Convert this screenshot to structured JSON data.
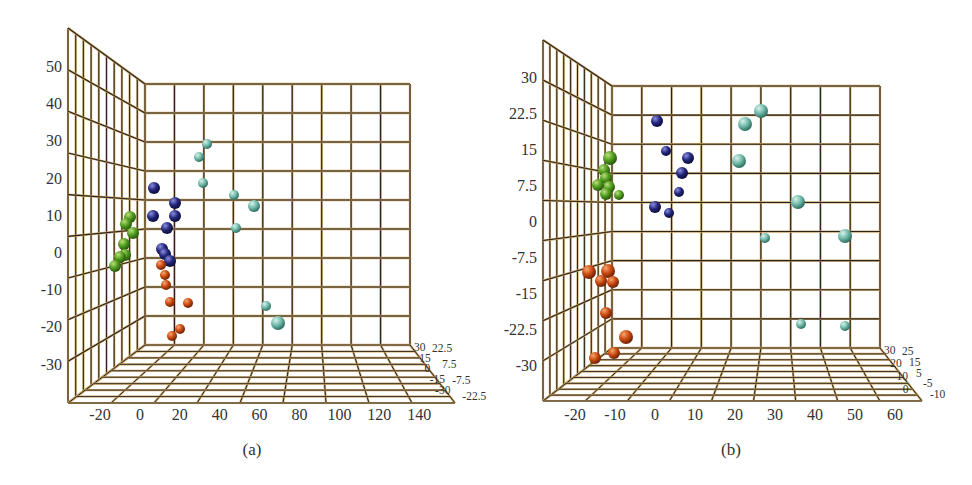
{
  "figure": {
    "panels": [
      "(a)",
      "(b)"
    ]
  },
  "colors": {
    "grid_dark": "#2b2418",
    "grid_tan": "#c8a46a",
    "green": "#4f9a1e",
    "navy": "#23257a",
    "orange": "#c9480f",
    "teal": "#6fb8a8"
  },
  "chart_data": [
    {
      "type": "scatter",
      "subtype": "3d-scatter",
      "caption": "(a)",
      "xlabel": "",
      "ylabel": "",
      "zlabel": "",
      "x_ticks": [
        "-20",
        "0",
        "20",
        "40",
        "60",
        "80",
        "100",
        "120",
        "140"
      ],
      "y_ticks": [
        "50",
        "40",
        "30",
        "20",
        "10",
        "0",
        "-10",
        "-20",
        "-30"
      ],
      "z_ticks_left": [
        "30",
        "15",
        "0",
        "-15",
        "-30"
      ],
      "z_ticks_right": [
        "22.5",
        "7.5",
        "-7.5",
        "-22.5"
      ],
      "xlim": [
        -30,
        150
      ],
      "ylim": [
        -40,
        60
      ],
      "zlim": [
        -30,
        30
      ],
      "grid": true,
      "series": [
        {
          "name": "cluster-green",
          "color": "#4f9a1e",
          "points": [
            [
              -18,
              9
            ],
            [
              -19,
              6
            ],
            [
              -20,
              4
            ],
            [
              -19,
              1
            ],
            [
              -20,
              -1
            ],
            [
              -19,
              -2
            ],
            [
              -24,
              -4
            ]
          ]
        },
        {
          "name": "cluster-navy",
          "color": "#23257a",
          "points": [
            [
              0,
              17
            ],
            [
              10,
              13
            ],
            [
              -2,
              10
            ],
            [
              10,
              10
            ],
            [
              6,
              7
            ],
            [
              2,
              0
            ],
            [
              4,
              -1
            ],
            [
              6,
              -2
            ]
          ]
        },
        {
          "name": "cluster-orange",
          "color": "#c9480f",
          "points": [
            [
              2,
              -4
            ],
            [
              4,
              -6
            ],
            [
              4,
              -9
            ],
            [
              6,
              -14
            ],
            [
              18,
              -14
            ],
            [
              10,
              -22
            ],
            [
              6,
              -24
            ]
          ]
        },
        {
          "name": "cluster-teal",
          "color": "#6fb8a8",
          "points": [
            [
              35,
              29
            ],
            [
              30,
              26
            ],
            [
              32,
              18
            ],
            [
              47,
              15
            ],
            [
              58,
              12
            ],
            [
              48,
              6
            ],
            [
              60,
              -16
            ],
            [
              68,
              -20
            ]
          ]
        }
      ],
      "screen_points": {
        "green": [
          [
            130,
            217,
            6
          ],
          [
            126,
            224,
            6
          ],
          [
            133,
            233,
            6
          ],
          [
            124,
            244,
            6
          ],
          [
            125,
            255,
            6
          ],
          [
            120,
            257,
            6
          ],
          [
            115,
            266,
            6
          ]
        ],
        "navy": [
          [
            154,
            188,
            6
          ],
          [
            175,
            203,
            6
          ],
          [
            153,
            216,
            6
          ],
          [
            175,
            216,
            6
          ],
          [
            167,
            228,
            6
          ],
          [
            162,
            249,
            6
          ],
          [
            165,
            254,
            6
          ],
          [
            170,
            261,
            6
          ]
        ],
        "orange": [
          [
            161,
            265,
            5
          ],
          [
            165,
            275,
            5
          ],
          [
            166,
            285,
            5
          ],
          [
            170,
            302,
            5
          ],
          [
            188,
            303,
            5
          ],
          [
            180,
            329,
            5
          ],
          [
            172,
            336,
            5
          ]
        ],
        "teal": [
          [
            207,
            144,
            5
          ],
          [
            199,
            157,
            5
          ],
          [
            203,
            183,
            5
          ],
          [
            234,
            195,
            5
          ],
          [
            254,
            206,
            6
          ],
          [
            236,
            228,
            5
          ],
          [
            266,
            306,
            5
          ],
          [
            278,
            323,
            7
          ]
        ]
      },
      "frame": {
        "back_left": 145,
        "back_right": 410,
        "back_top": 84,
        "back_bottom": 345,
        "side_left": 68,
        "side_top": 28,
        "front_bottom": 403,
        "floor_right": 455,
        "y_tick_top": 66,
        "y_tick_step": 37.2,
        "x_tick_left": 100,
        "x_tick_step": 39.9,
        "x_label_y": 420,
        "caption_x": 252,
        "caption_y": 455
      }
    },
    {
      "type": "scatter",
      "subtype": "3d-scatter",
      "caption": "(b)",
      "xlabel": "",
      "ylabel": "",
      "zlabel": "",
      "x_ticks": [
        "-20",
        "-10",
        "0",
        "10",
        "20",
        "30",
        "40",
        "50",
        "60"
      ],
      "y_ticks": [
        "30",
        "22.5",
        "15",
        "7.5",
        "0",
        "-7.5",
        "-15",
        "-22.5",
        "-30"
      ],
      "z_ticks_left": [
        "30",
        "20",
        "10",
        "0"
      ],
      "z_ticks_right": [
        "25",
        "15",
        "5",
        "-5",
        "-10"
      ],
      "xlim": [
        -25,
        65
      ],
      "ylim": [
        -37.5,
        37.5
      ],
      "zlim": [
        -10,
        30
      ],
      "grid": true,
      "series": [
        {
          "name": "cluster-green",
          "color": "#4f9a1e",
          "points": [
            [
              -10,
              13
            ],
            [
              -11,
              11
            ],
            [
              -11,
              10
            ],
            [
              -10,
              8
            ],
            [
              -13,
              7
            ],
            [
              -11,
              6
            ],
            [
              -7,
              5
            ]
          ]
        },
        {
          "name": "cluster-navy",
          "color": "#23257a",
          "points": [
            [
              0,
              21
            ],
            [
              3,
              14
            ],
            [
              8,
              13
            ],
            [
              7,
              10
            ],
            [
              6,
              6
            ],
            [
              0,
              3
            ],
            [
              3,
              1
            ]
          ]
        },
        {
          "name": "cluster-teal",
          "color": "#6fb8a8",
          "points": [
            [
              27,
              23
            ],
            [
              24,
              19
            ],
            [
              22,
              12
            ],
            [
              40,
              4
            ],
            [
              30,
              -4
            ],
            [
              52,
              -4
            ],
            [
              40,
              -22
            ],
            [
              52,
              -22
            ]
          ]
        },
        {
          "name": "cluster-orange",
          "color": "#c9480f",
          "points": [
            [
              -16,
              -10
            ],
            [
              -12,
              -10
            ],
            [
              -14,
              -13
            ],
            [
              -11,
              -13
            ],
            [
              -13,
              -19
            ],
            [
              -7,
              -24
            ],
            [
              -17,
              -29
            ],
            [
              -10,
              -28
            ]
          ]
        }
      ],
      "screen_points": {
        "green": [
          [
            610,
            158,
            7
          ],
          [
            604,
            170,
            6
          ],
          [
            606,
            178,
            6
          ],
          [
            609,
            187,
            6
          ],
          [
            598,
            185,
            6
          ],
          [
            606,
            194,
            6
          ],
          [
            619,
            195,
            5
          ]
        ],
        "navy": [
          [
            657,
            121,
            6
          ],
          [
            666,
            151,
            5
          ],
          [
            688,
            158,
            6
          ],
          [
            682,
            173,
            6
          ],
          [
            679,
            192,
            5
          ],
          [
            655,
            207,
            6
          ],
          [
            669,
            213,
            5
          ]
        ],
        "teal": [
          [
            761,
            111,
            7
          ],
          [
            745,
            124,
            7
          ],
          [
            739,
            161,
            7
          ],
          [
            798,
            202,
            7
          ],
          [
            765,
            238,
            5
          ],
          [
            845,
            236,
            7
          ],
          [
            801,
            324,
            5
          ],
          [
            845,
            326,
            5
          ]
        ],
        "orange": [
          [
            589,
            272,
            7
          ],
          [
            608,
            271,
            7
          ],
          [
            601,
            281,
            6
          ],
          [
            613,
            282,
            6
          ],
          [
            606,
            313,
            6
          ],
          [
            626,
            337,
            7
          ],
          [
            595,
            358,
            6
          ],
          [
            614,
            353,
            6
          ]
        ]
      },
      "frame": {
        "back_left": 612,
        "back_right": 880,
        "back_top": 86,
        "back_bottom": 348,
        "side_left": 543,
        "side_top": 40,
        "front_bottom": 401,
        "floor_right": 922,
        "y_tick_top": 77,
        "y_tick_step": 36.0,
        "x_tick_left": 575,
        "x_tick_step": 40.0,
        "x_label_y": 420,
        "caption_x": 731,
        "caption_y": 455
      }
    }
  ]
}
